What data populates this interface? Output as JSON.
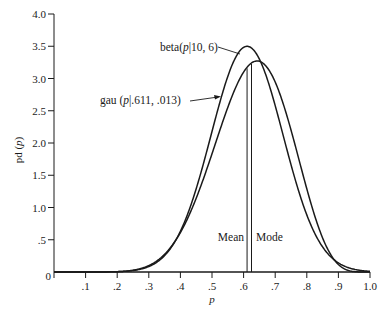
{
  "chart_data": {
    "type": "line",
    "title": "",
    "xlabel": "p",
    "ylabel": "pd (p)",
    "xlim": [
      0,
      1.0
    ],
    "ylim": [
      0,
      4.0
    ],
    "grid": false,
    "x_ticks": [
      ".1",
      ".2",
      ".3",
      ".4",
      ".5",
      ".6",
      ".7",
      ".8",
      ".9",
      "1.0"
    ],
    "x_origin_label": "0",
    "y_ticks": [
      ".5",
      "1.0",
      "1.5",
      "2.0",
      "2.5",
      "3.0",
      "3.5",
      "4.0"
    ],
    "series": [
      {
        "name": "beta(p|10, 6)",
        "kind": "beta",
        "params": {
          "a": 10,
          "b": 6
        },
        "label_prefix": "beta(",
        "label_var": "p",
        "label_suffix": "|10, 6)",
        "x": [
          0.2,
          0.3,
          0.4,
          0.5,
          0.55,
          0.6,
          0.643,
          0.7,
          0.75,
          0.8,
          0.85,
          0.9,
          0.95,
          1.0
        ],
        "values": [
          0.01,
          0.12,
          0.7,
          1.83,
          2.55,
          3.14,
          3.4,
          3.13,
          2.61,
          1.85,
          1.02,
          0.4,
          0.07,
          0.0
        ]
      },
      {
        "name": "gau (p|.611, .013)",
        "kind": "gaussian",
        "params": {
          "mean": 0.611,
          "variance": 0.013
        },
        "label_prefix": "gau (",
        "label_var": "p",
        "label_suffix": "|.611, .013)",
        "x": [
          0.2,
          0.3,
          0.4,
          0.5,
          0.55,
          0.6,
          0.611,
          0.7,
          0.75,
          0.8,
          0.85,
          0.9,
          0.95,
          1.0
        ],
        "values": [
          0.0,
          0.11,
          0.64,
          1.94,
          2.91,
          3.48,
          3.5,
          2.58,
          1.67,
          0.89,
          0.39,
          0.14,
          0.04,
          0.01
        ]
      }
    ],
    "annotations": [
      {
        "text": "Mean",
        "x": 0.611
      },
      {
        "text": "Mode",
        "x": 0.625
      }
    ]
  },
  "labels": {
    "mean": "Mean",
    "mode": "Mode",
    "x_axis": "p",
    "y_axis_prefix": "pd (",
    "y_axis_var": "p",
    "y_axis_suffix": ")"
  }
}
